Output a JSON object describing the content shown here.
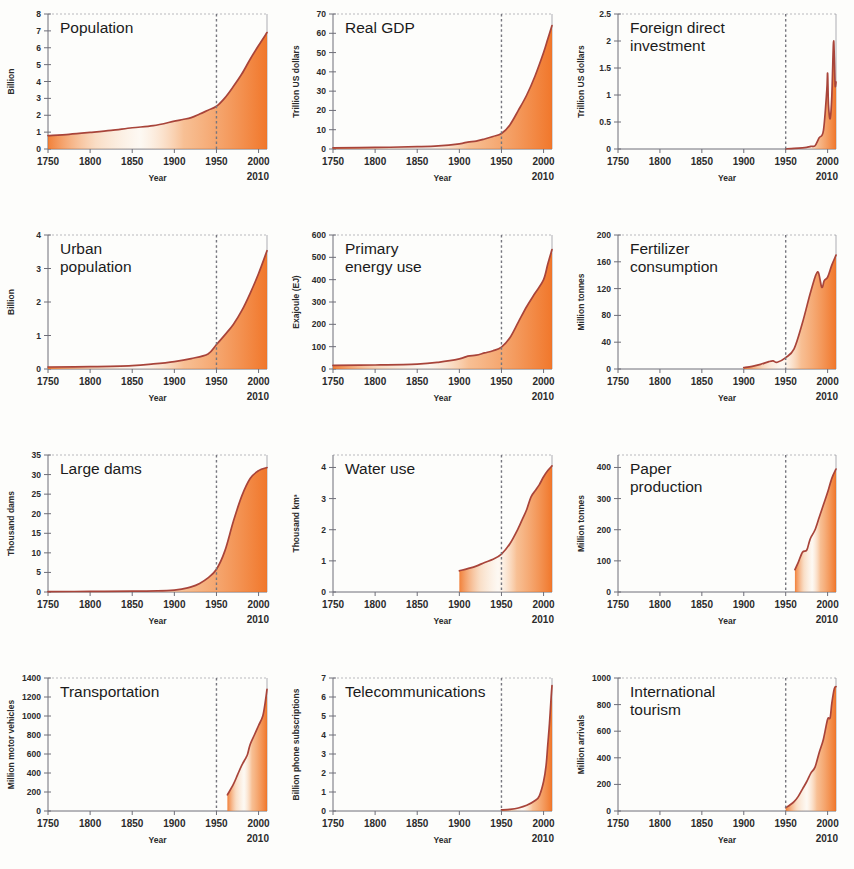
{
  "figure": {
    "name": "Great Acceleration socio-economic trends",
    "accent_color": "#f07020",
    "line_color": "#a8443a",
    "marker_year": 1950,
    "xlabel": "Year",
    "x_ticks": [
      "1750",
      "1800",
      "1850",
      "1900",
      "1950",
      "2000"
    ],
    "x_end_label": "2010",
    "xlim": [
      1750,
      2010
    ]
  },
  "chart_data": [
    {
      "type": "area",
      "title": "Population",
      "ylabel": "Billion",
      "xlabel": "Year",
      "ylim": [
        0,
        8
      ],
      "xlim": [
        1750,
        2010
      ],
      "y_ticks": [
        "0",
        "1",
        "2",
        "3",
        "4",
        "5",
        "6",
        "7",
        "8"
      ],
      "x_ticks": [
        "1750",
        "1800",
        "1850",
        "1900",
        "1950",
        "2000"
      ],
      "x_end_label": "2010",
      "grid": false,
      "annotation_year": 1950,
      "x": [
        1750,
        1775,
        1800,
        1825,
        1850,
        1875,
        1900,
        1910,
        1920,
        1930,
        1940,
        1950,
        1960,
        1970,
        1980,
        1990,
        2000,
        2010
      ],
      "values": [
        0.79,
        0.87,
        0.98,
        1.1,
        1.26,
        1.38,
        1.65,
        1.75,
        1.86,
        2.07,
        2.3,
        2.53,
        3.03,
        3.7,
        4.44,
        5.32,
        6.13,
        6.9
      ]
    },
    {
      "type": "area",
      "title": "Real GDP",
      "ylabel": "Trillion US dollars",
      "xlabel": "Year",
      "ylim": [
        0,
        70
      ],
      "xlim": [
        1750,
        2010
      ],
      "y_ticks": [
        "0",
        "10",
        "20",
        "30",
        "40",
        "50",
        "60",
        "70"
      ],
      "x_ticks": [
        "1750",
        "1800",
        "1850",
        "1900",
        "1950",
        "2000"
      ],
      "x_end_label": "2010",
      "grid": false,
      "annotation_year": 1950,
      "x": [
        1750,
        1800,
        1850,
        1875,
        1900,
        1910,
        1920,
        1930,
        1940,
        1950,
        1960,
        1970,
        1980,
        1990,
        2000,
        2005,
        2010
      ],
      "values": [
        0.6,
        0.8,
        1.2,
        1.6,
        2.7,
        3.6,
        4.1,
        5.2,
        6.5,
        8.0,
        12.5,
        20.0,
        28.0,
        38.0,
        50.0,
        57.0,
        64.0
      ]
    },
    {
      "type": "area",
      "title": "Foreign direct investment",
      "ylabel": "Trillion US dollars",
      "xlabel": "Year",
      "ylim": [
        0,
        2.5
      ],
      "xlim": [
        1750,
        2010
      ],
      "y_ticks": [
        "0",
        "0.5",
        "1",
        "1.5",
        "2",
        "2.5"
      ],
      "x_ticks": [
        "1750",
        "1800",
        "1850",
        "1900",
        "1950",
        "2000"
      ],
      "x_end_label": "2010",
      "grid": false,
      "annotation_year": 1950,
      "x": [
        1950,
        1960,
        1970,
        1975,
        1980,
        1985,
        1990,
        1995,
        1999,
        2000,
        2001,
        2003,
        2005,
        2007,
        2008,
        2009,
        2010
      ],
      "values": [
        0.004,
        0.01,
        0.02,
        0.03,
        0.05,
        0.06,
        0.21,
        0.34,
        1.08,
        1.4,
        0.83,
        0.56,
        0.97,
        1.97,
        1.7,
        1.18,
        1.24
      ]
    },
    {
      "type": "area",
      "title": "Urban population",
      "ylabel": "Billion",
      "xlabel": "Year",
      "ylim": [
        0,
        4
      ],
      "xlim": [
        1750,
        2010
      ],
      "y_ticks": [
        "0",
        "1",
        "2",
        "3",
        "4"
      ],
      "x_ticks": [
        "1750",
        "1800",
        "1850",
        "1900",
        "1950",
        "2000"
      ],
      "x_end_label": "2010",
      "grid": false,
      "annotation_year": 1950,
      "x": [
        1750,
        1800,
        1850,
        1875,
        1900,
        1920,
        1940,
        1950,
        1960,
        1970,
        1980,
        1990,
        2000,
        2010
      ],
      "values": [
        0.06,
        0.07,
        0.1,
        0.15,
        0.22,
        0.31,
        0.45,
        0.73,
        1.02,
        1.33,
        1.74,
        2.26,
        2.85,
        3.53
      ]
    },
    {
      "type": "area",
      "title": "Primary energy use",
      "ylabel": "Exajoule (EJ)",
      "xlabel": "Year",
      "ylim": [
        0,
        600
      ],
      "xlim": [
        1750,
        2010
      ],
      "y_ticks": [
        "0",
        "100",
        "200",
        "300",
        "400",
        "500",
        "600"
      ],
      "x_ticks": [
        "1750",
        "1800",
        "1850",
        "1900",
        "1950",
        "2000"
      ],
      "x_end_label": "2010",
      "grid": false,
      "annotation_year": 1950,
      "x": [
        1750,
        1800,
        1850,
        1875,
        1900,
        1910,
        1920,
        1930,
        1940,
        1950,
        1960,
        1970,
        1980,
        1990,
        2000,
        2005,
        2010
      ],
      "values": [
        16,
        18,
        22,
        30,
        45,
        58,
        62,
        72,
        82,
        98,
        140,
        210,
        280,
        340,
        400,
        470,
        535
      ]
    },
    {
      "type": "area",
      "title": "Fertilizer consumption",
      "ylabel": "Million tonnes",
      "xlabel": "Year",
      "ylim": [
        0,
        200
      ],
      "xlim": [
        1750,
        2010
      ],
      "y_ticks": [
        "0",
        "40",
        "80",
        "120",
        "160",
        "200"
      ],
      "x_ticks": [
        "1750",
        "1800",
        "1850",
        "1900",
        "1950",
        "2000"
      ],
      "x_end_label": "2010",
      "grid": false,
      "annotation_year": 1950,
      "x": [
        1900,
        1910,
        1920,
        1930,
        1935,
        1940,
        1950,
        1960,
        1970,
        1980,
        1988,
        1993,
        1996,
        2000,
        2005,
        2010
      ],
      "values": [
        2,
        4,
        7,
        11,
        12,
        10,
        17,
        30,
        69,
        116,
        145,
        122,
        132,
        137,
        155,
        170
      ]
    },
    {
      "type": "area",
      "title": "Large dams",
      "ylabel": "Thousand dams",
      "xlabel": "Year",
      "ylim": [
        0,
        35
      ],
      "xlim": [
        1750,
        2010
      ],
      "y_ticks": [
        "0",
        "5",
        "10",
        "15",
        "20",
        "25",
        "30",
        "35"
      ],
      "x_ticks": [
        "1750",
        "1800",
        "1850",
        "1900",
        "1950",
        "2000"
      ],
      "x_end_label": "2010",
      "grid": false,
      "annotation_year": 1950,
      "x": [
        1750,
        1800,
        1850,
        1880,
        1900,
        1910,
        1920,
        1930,
        1940,
        1950,
        1960,
        1970,
        1980,
        1990,
        2000,
        2010
      ],
      "values": [
        0.1,
        0.15,
        0.2,
        0.3,
        0.5,
        0.8,
        1.3,
        2.2,
        3.6,
        5.8,
        10.5,
        18.0,
        24.5,
        29.0,
        31.0,
        31.8
      ]
    },
    {
      "type": "area",
      "title": "Water use",
      "ylabel": "Thousand km³",
      "xlabel": "Year",
      "ylim": [
        0,
        4.4
      ],
      "xlim": [
        1750,
        2010
      ],
      "y_ticks": [
        "0",
        "1",
        "2",
        "3",
        "4"
      ],
      "x_ticks": [
        "1750",
        "1800",
        "1850",
        "1900",
        "1950",
        "2000"
      ],
      "x_end_label": "2010",
      "grid": false,
      "annotation_year": 1950,
      "x": [
        1900,
        1910,
        1920,
        1930,
        1940,
        1950,
        1960,
        1970,
        1975,
        1980,
        1985,
        1990,
        1995,
        2000,
        2005,
        2010
      ],
      "values": [
        0.68,
        0.75,
        0.83,
        0.95,
        1.05,
        1.22,
        1.55,
        2.05,
        2.35,
        2.65,
        3.05,
        3.25,
        3.45,
        3.7,
        3.9,
        4.05
      ]
    },
    {
      "type": "area",
      "title": "Paper production",
      "ylabel": "Million tonnes",
      "xlabel": "Year",
      "ylim": [
        0,
        440
      ],
      "xlim": [
        1750,
        2010
      ],
      "y_ticks": [
        "0",
        "100",
        "200",
        "300",
        "400"
      ],
      "x_ticks": [
        "1750",
        "1800",
        "1850",
        "1900",
        "1950",
        "2000"
      ],
      "x_end_label": "2010",
      "grid": false,
      "annotation_year": 1950,
      "x": [
        1961,
        1965,
        1970,
        1975,
        1978,
        1980,
        1985,
        1990,
        1995,
        2000,
        2005,
        2010
      ],
      "values": [
        72,
        95,
        128,
        134,
        160,
        175,
        200,
        240,
        280,
        320,
        365,
        395
      ]
    },
    {
      "type": "area",
      "title": "Transportation",
      "ylabel": "Million motor vehicles",
      "xlabel": "Year",
      "ylim": [
        0,
        1400
      ],
      "xlim": [
        1750,
        2010
      ],
      "y_ticks": [
        "0",
        "200",
        "400",
        "600",
        "800",
        "1000",
        "1200",
        "1400"
      ],
      "x_ticks": [
        "1750",
        "1800",
        "1850",
        "1900",
        "1950",
        "2000"
      ],
      "x_end_label": "2010",
      "grid": false,
      "annotation_year": 1950,
      "x": [
        1963,
        1970,
        1975,
        1980,
        1985,
        1987,
        1990,
        1995,
        2000,
        2005,
        2008,
        2010
      ],
      "values": [
        170,
        280,
        380,
        480,
        560,
        600,
        700,
        800,
        900,
        1000,
        1150,
        1280
      ]
    },
    {
      "type": "area",
      "title": "Telecommunications",
      "ylabel": "Billion phone subscriptions",
      "xlabel": "Year",
      "ylim": [
        0,
        7
      ],
      "xlim": [
        1750,
        2010
      ],
      "y_ticks": [
        "0",
        "1",
        "2",
        "3",
        "4",
        "5",
        "6",
        "7"
      ],
      "x_ticks": [
        "1750",
        "1800",
        "1850",
        "1900",
        "1950",
        "2000"
      ],
      "x_end_label": "2010",
      "grid": false,
      "annotation_year": 1950,
      "x": [
        1950,
        1960,
        1970,
        1980,
        1990,
        1995,
        2000,
        2003,
        2005,
        2007,
        2009,
        2010
      ],
      "values": [
        0.06,
        0.09,
        0.16,
        0.3,
        0.55,
        0.8,
        1.55,
        2.4,
        3.5,
        4.6,
        6.0,
        6.6
      ]
    },
    {
      "type": "area",
      "title": "International tourism",
      "ylabel": "Million arrivals",
      "xlabel": "Year",
      "ylim": [
        0,
        1000
      ],
      "xlim": [
        1750,
        2010
      ],
      "y_ticks": [
        "0",
        "200",
        "400",
        "600",
        "800",
        "1000"
      ],
      "x_ticks": [
        "1750",
        "1800",
        "1850",
        "1900",
        "1950",
        "2000"
      ],
      "x_end_label": "2010",
      "grid": false,
      "annotation_year": 1950,
      "x": [
        1950,
        1955,
        1960,
        1965,
        1970,
        1975,
        1980,
        1985,
        1990,
        1995,
        2000,
        2003,
        2005,
        2008,
        2010
      ],
      "values": [
        25,
        45,
        70,
        110,
        165,
        220,
        285,
        330,
        440,
        540,
        690,
        700,
        810,
        920,
        935
      ]
    }
  ]
}
